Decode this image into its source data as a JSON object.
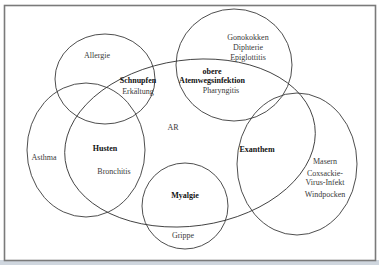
{
  "diagram": {
    "type": "venn",
    "sets": [
      {
        "id": "allergie",
        "name": "Allergie"
      },
      {
        "id": "obere-atemwegsinfektion",
        "name": "obere Atemwegsinfektion"
      },
      {
        "id": "asthma",
        "name": "Asthma"
      },
      {
        "id": "exanthem",
        "name": "Exanthem"
      },
      {
        "id": "myalgie",
        "name": "Myalgie"
      },
      {
        "id": "ar",
        "name": "AR"
      }
    ],
    "labels": {
      "allergie": "Allergie",
      "schnupfen": "Schnupfen",
      "erkaeltung": "Erkältung",
      "gonokokken": "Gonokokken",
      "diphterie": "Diphterie",
      "epiglottitis": "Epiglottitis",
      "obere": "obere",
      "atemwegsinfektion": "Atemwegsinfektion",
      "pharyngitis": "Pharyngitis",
      "ar": "AR",
      "asthma": "Asthma",
      "husten": "Husten",
      "bronchitis": "Bronchitis",
      "exanthem": "Exanthem",
      "masern": "Masern",
      "coxsackie1": "Coxsackie-",
      "coxsackie2": "Virus-Infekt",
      "windpocken": "Windpocken",
      "myalgie": "Myalgie",
      "grippe": "Grippe"
    }
  }
}
